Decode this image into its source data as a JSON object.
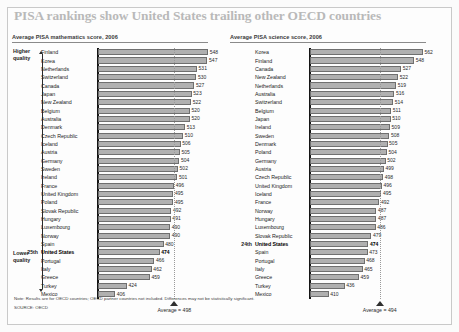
{
  "headline": "PISA rankings show United States trailing other OECD countries",
  "quality": {
    "higher_line1": "Higher",
    "higher_line2": "quality",
    "lower_line1": "Lower",
    "lower_line2": "quality"
  },
  "note": "Note: Results are for OECD countries; OECD partner countries not included. Differences may not be statistically significant.",
  "source": "SOURCE: OECD",
  "chart_data": [
    {
      "type": "bar",
      "title": "Average PISA mathematics score, 2006",
      "id": "math",
      "orientation": "horizontal",
      "xlabel": "",
      "ylabel": "",
      "xlim": [
        380,
        560
      ],
      "grid": false,
      "legend": null,
      "average_label": "Average = 498",
      "average_value": 498,
      "highlight": "United States",
      "highlight_rank": "25th",
      "categories": [
        "Finland",
        "Korea",
        "Netherlands",
        "Switzerland",
        "Canada",
        "Japan",
        "New Zealand",
        "Belgium",
        "Australia",
        "Denmark",
        "Czech Republic",
        "Iceland",
        "Austria",
        "Germany",
        "Sweden",
        "Ireland",
        "France",
        "United Kingdom",
        "Poland",
        "Slovak Republic",
        "Hungary",
        "Luxembourg",
        "Norway",
        "Spain",
        "United States",
        "Portugal",
        "Italy",
        "Greece",
        "Turkey",
        "Mexico"
      ],
      "values": [
        548,
        547,
        531,
        530,
        527,
        523,
        522,
        520,
        520,
        513,
        510,
        506,
        505,
        504,
        502,
        501,
        496,
        495,
        495,
        492,
        491,
        490,
        490,
        480,
        474,
        466,
        462,
        459,
        424,
        406
      ]
    },
    {
      "type": "bar",
      "title": "Average PISA science score, 2006",
      "id": "science",
      "orientation": "horizontal",
      "xlabel": "",
      "ylabel": "",
      "xlim": [
        380,
        580
      ],
      "grid": false,
      "legend": null,
      "average_label": "Average = 494",
      "average_value": 494,
      "highlight": "United States",
      "highlight_rank": "24th",
      "categories": [
        "Korea",
        "Finland",
        "Canada",
        "New Zealand",
        "Netherlands",
        "Australia",
        "Switzerland",
        "Belgium",
        "Japan",
        "Ireland",
        "Sweden",
        "Denmark",
        "Poland",
        "Germany",
        "Austria",
        "Czech Republic",
        "United Kingdom",
        "Iceland",
        "France",
        "Norway",
        "Hungary",
        "Luxembourg",
        "Slovak Republic",
        "United States",
        "Spain",
        "Portugal",
        "Italy",
        "Greece",
        "Turkey",
        "Mexico"
      ],
      "values": [
        562,
        548,
        527,
        522,
        519,
        516,
        514,
        511,
        510,
        509,
        508,
        505,
        504,
        502,
        499,
        498,
        496,
        495,
        492,
        487,
        487,
        486,
        479,
        474,
        473,
        468,
        465,
        459,
        436,
        410
      ]
    }
  ]
}
